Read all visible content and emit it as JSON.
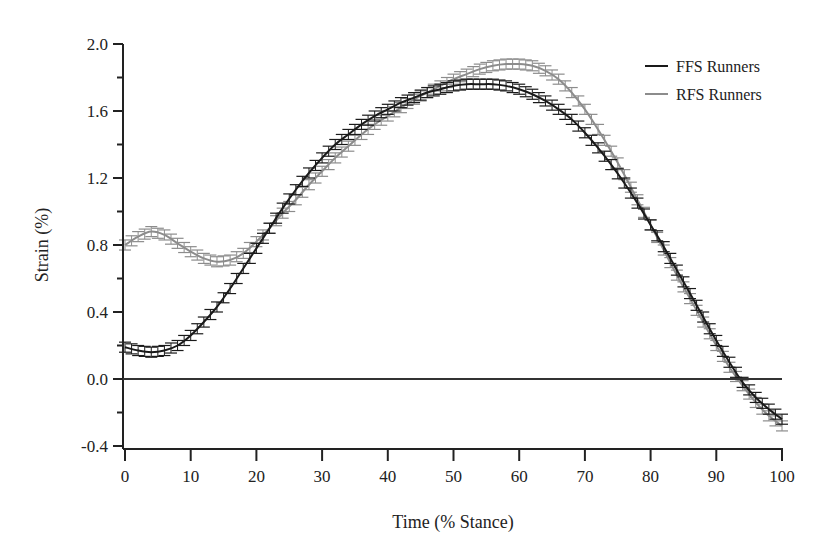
{
  "chart_data": {
    "type": "line",
    "title": "",
    "xlabel": "Time (% Stance)",
    "ylabel": "Strain (%)",
    "xlim": [
      0,
      100
    ],
    "ylim": [
      -0.4,
      2.0
    ],
    "xticks": [
      0,
      10,
      20,
      30,
      40,
      50,
      60,
      70,
      80,
      90,
      100
    ],
    "xtick_labels": [
      "0",
      "10",
      "20",
      "30",
      "40",
      "50",
      "60",
      "70",
      "80",
      "90",
      "100"
    ],
    "yticks": [
      -0.4,
      0.0,
      0.4,
      0.8,
      1.2,
      1.6,
      2.0
    ],
    "ytick_labels": [
      "-0.4",
      "0.0",
      "0.4",
      "0.8",
      "1.2",
      "1.6",
      "2.0"
    ],
    "grid": false,
    "zero_line": true,
    "error_bars": true,
    "legend_position": "top-right",
    "x": [
      0,
      2,
      4,
      6,
      8,
      10,
      12,
      14,
      16,
      18,
      20,
      22,
      24,
      26,
      28,
      30,
      32,
      34,
      36,
      38,
      40,
      42,
      44,
      46,
      48,
      50,
      52,
      54,
      56,
      58,
      60,
      62,
      64,
      66,
      68,
      70,
      72,
      74,
      76,
      78,
      80,
      82,
      84,
      86,
      88,
      90,
      92,
      94,
      96,
      98,
      100
    ],
    "series": [
      {
        "name": "FFS Runners",
        "color": "#1a1a1a",
        "error": 0.03,
        "values": [
          0.19,
          0.17,
          0.16,
          0.17,
          0.2,
          0.26,
          0.34,
          0.43,
          0.54,
          0.66,
          0.78,
          0.9,
          1.02,
          1.13,
          1.23,
          1.32,
          1.4,
          1.46,
          1.52,
          1.57,
          1.61,
          1.65,
          1.68,
          1.71,
          1.73,
          1.75,
          1.76,
          1.76,
          1.76,
          1.75,
          1.73,
          1.7,
          1.66,
          1.61,
          1.55,
          1.47,
          1.38,
          1.28,
          1.17,
          1.05,
          0.92,
          0.79,
          0.65,
          0.51,
          0.37,
          0.23,
          0.1,
          -0.02,
          -0.11,
          -0.18,
          -0.24
        ]
      },
      {
        "name": "RFS Runners",
        "color": "#8c8c8c",
        "error": 0.03,
        "values": [
          0.8,
          0.85,
          0.88,
          0.86,
          0.81,
          0.76,
          0.72,
          0.7,
          0.71,
          0.75,
          0.82,
          0.9,
          0.99,
          1.07,
          1.16,
          1.24,
          1.32,
          1.39,
          1.46,
          1.52,
          1.57,
          1.62,
          1.67,
          1.71,
          1.75,
          1.79,
          1.82,
          1.85,
          1.87,
          1.88,
          1.88,
          1.87,
          1.84,
          1.79,
          1.71,
          1.61,
          1.49,
          1.36,
          1.22,
          1.07,
          0.92,
          0.77,
          0.62,
          0.48,
          0.34,
          0.2,
          0.07,
          -0.04,
          -0.14,
          -0.22,
          -0.28
        ]
      }
    ]
  },
  "legend": {
    "items": [
      {
        "label": "FFS Runners",
        "color": "#1a1a1a"
      },
      {
        "label": "RFS Runners",
        "color": "#8c8c8c"
      }
    ]
  }
}
